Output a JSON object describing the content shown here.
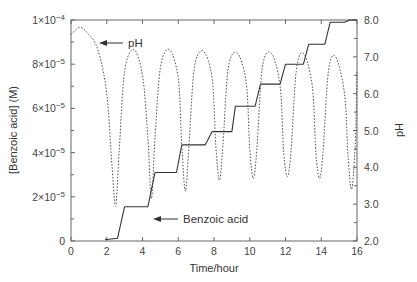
{
  "chart_data": {
    "type": "line",
    "title": "",
    "xlabel": "Time/hour",
    "ylabel": "[Benzoic acid] (M)",
    "y2label": "pH",
    "xlim": [
      0,
      16
    ],
    "ylim": [
      0,
      0.0001
    ],
    "y2lim": [
      2.0,
      8.0
    ],
    "grid": false,
    "legend": "none (inline arrow annotations)",
    "x_ticks": [
      "0",
      "2",
      "4",
      "6",
      "8",
      "10",
      "12",
      "14",
      "16"
    ],
    "y_ticks": [
      "0",
      "2×10⁻⁵",
      "4×10⁻⁵",
      "6×10⁻⁵",
      "8×10⁻⁵",
      "1×10⁻⁴"
    ],
    "y2_ticks": [
      "2.0",
      "3.0",
      "4.0",
      "5.0",
      "6.0",
      "7.0",
      "8.0"
    ],
    "annotations": [
      {
        "text": "pH",
        "points_to_series": "pH",
        "at": [
          1.2,
          7.65
        ]
      },
      {
        "text": "Benzoic acid",
        "points_to_series": "Benzoic acid",
        "at": [
          4.4,
          1.55e-05
        ]
      }
    ],
    "series": [
      {
        "name": "Benzoic acid",
        "axis": "left",
        "style": "solid",
        "x": [
          1.9,
          2.0,
          2.6,
          3.0,
          4.0,
          4.3,
          4.7,
          5.6,
          5.9,
          6.2,
          7.3,
          7.5,
          7.9,
          8.8,
          9.0,
          9.2,
          10.1,
          10.3,
          10.6,
          11.5,
          11.7,
          12.0,
          12.8,
          13.0,
          13.3,
          14.0,
          14.2,
          14.5,
          15.1,
          15.3,
          15.6,
          16.0
        ],
        "values": [
          7e-07,
          7e-07,
          1.2e-06,
          1.55e-05,
          1.55e-05,
          1.55e-05,
          3.1e-05,
          3.1e-05,
          3.1e-05,
          4.35e-05,
          4.35e-05,
          4.35e-05,
          4.95e-05,
          4.95e-05,
          4.95e-05,
          6.1e-05,
          6.1e-05,
          6.1e-05,
          7.1e-05,
          7.1e-05,
          7.1e-05,
          8e-05,
          8e-05,
          8e-05,
          8.9e-05,
          8.9e-05,
          8.9e-05,
          9.9e-05,
          9.9e-05,
          9.9e-05,
          0.0001,
          0.0001
        ]
      },
      {
        "name": "pH",
        "axis": "right",
        "style": "dotted",
        "x": [
          0.0,
          0.5,
          1.0,
          1.5,
          2.0,
          2.3,
          2.5,
          2.7,
          3.0,
          3.5,
          4.0,
          4.3,
          4.5,
          4.7,
          5.0,
          5.5,
          6.0,
          6.2,
          6.4,
          6.6,
          6.9,
          7.4,
          7.9,
          8.1,
          8.3,
          8.5,
          8.8,
          9.3,
          9.8,
          10.0,
          10.2,
          10.4,
          10.7,
          11.2,
          11.7,
          11.9,
          12.1,
          12.3,
          12.6,
          13.0,
          13.5,
          13.7,
          13.9,
          14.1,
          14.4,
          14.8,
          15.3,
          15.5,
          15.7,
          15.9,
          16.0
        ],
        "values": [
          7.6,
          7.8,
          7.6,
          7.2,
          6.0,
          4.0,
          2.95,
          4.5,
          6.6,
          7.2,
          6.5,
          4.8,
          3.15,
          4.8,
          6.7,
          7.2,
          6.4,
          4.6,
          3.35,
          4.6,
          6.7,
          7.15,
          6.4,
          4.6,
          3.65,
          4.6,
          6.7,
          7.1,
          6.3,
          4.5,
          3.7,
          4.5,
          6.7,
          7.1,
          6.2,
          4.4,
          3.75,
          4.4,
          6.6,
          7.1,
          6.2,
          4.4,
          3.7,
          4.4,
          6.6,
          7.0,
          6.0,
          4.3,
          3.4,
          4.6,
          6.6
        ]
      }
    ]
  },
  "labels": {
    "xlabel": "Time/hour",
    "ylabel": "[Benzoic acid] (M)",
    "y2label": "pH",
    "annot_ph": "pH",
    "annot_benzoic": "Benzoic acid"
  }
}
